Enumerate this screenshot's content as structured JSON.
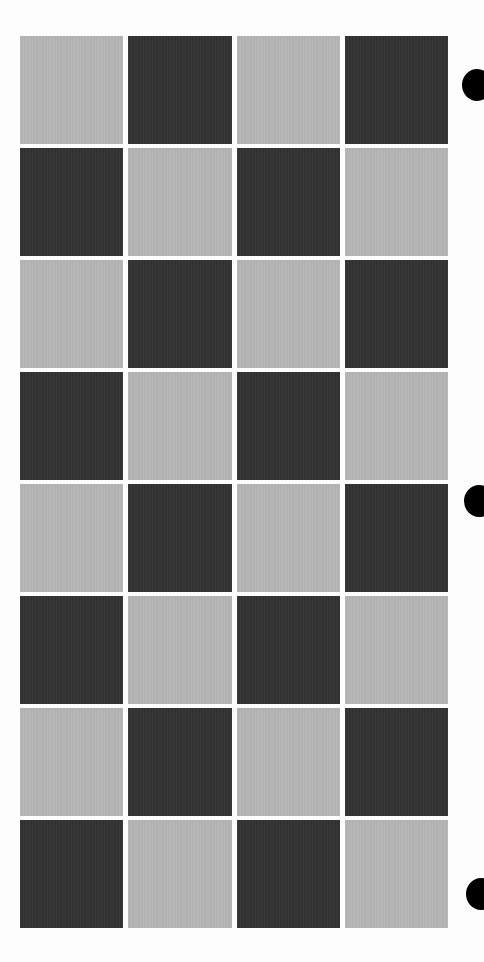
{
  "board": {
    "rows": 8,
    "columns": 4,
    "first_cell": "light",
    "colors": {
      "light": "#b6b6b6",
      "dark": "#333333",
      "background": "#fdfdfd",
      "marker": "#000000"
    },
    "cells": [
      [
        "light",
        "dark",
        "light",
        "dark"
      ],
      [
        "dark",
        "light",
        "dark",
        "light"
      ],
      [
        "light",
        "dark",
        "light",
        "dark"
      ],
      [
        "dark",
        "light",
        "dark",
        "light"
      ],
      [
        "light",
        "dark",
        "light",
        "dark"
      ],
      [
        "dark",
        "light",
        "dark",
        "light"
      ],
      [
        "light",
        "dark",
        "light",
        "dark"
      ],
      [
        "dark",
        "light",
        "dark",
        "light"
      ]
    ]
  },
  "markers": [
    {
      "name": "registration-mark-top",
      "x": 462,
      "y": 85
    },
    {
      "name": "registration-mark-middle",
      "x": 464,
      "y": 501
    },
    {
      "name": "registration-mark-bottom",
      "x": 466,
      "y": 894
    }
  ]
}
